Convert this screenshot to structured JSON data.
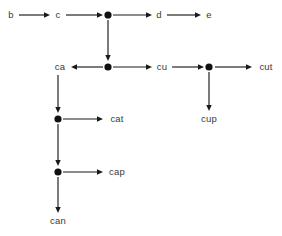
{
  "diagram": {
    "kind": "trie-graph",
    "background_color": "#ffffff",
    "stroke_color": "#1a1a1a",
    "text_color": "#3a3a3a",
    "dot_color": "#111111",
    "canvas": {
      "width": 282,
      "height": 236
    },
    "text_nodes": [
      {
        "id": "b",
        "label": "b",
        "x": 11,
        "y": 15
      },
      {
        "id": "c",
        "label": "c",
        "x": 58,
        "y": 15
      },
      {
        "id": "d",
        "label": "d",
        "x": 159,
        "y": 15
      },
      {
        "id": "e",
        "label": "e",
        "x": 209,
        "y": 15
      },
      {
        "id": "ca",
        "label": "ca",
        "x": 60,
        "y": 67
      },
      {
        "id": "cu",
        "label": "cu",
        "x": 162,
        "y": 67
      },
      {
        "id": "cut",
        "label": "cut",
        "x": 266,
        "y": 67
      },
      {
        "id": "cup",
        "label": "cup",
        "x": 209,
        "y": 119
      },
      {
        "id": "cat",
        "label": "cat",
        "x": 117,
        "y": 119
      },
      {
        "id": "cap",
        "label": "cap",
        "x": 117,
        "y": 172
      },
      {
        "id": "can",
        "label": "can",
        "x": 58,
        "y": 221
      }
    ],
    "dot_nodes": [
      {
        "id": "dot-c-branch",
        "x": 108,
        "y": 15,
        "r": 3.6
      },
      {
        "id": "dot-ca-branch",
        "x": 108,
        "y": 67,
        "r": 3.6
      },
      {
        "id": "dot-cu-branch",
        "x": 209,
        "y": 67,
        "r": 3.6
      },
      {
        "id": "dot-cat-branch",
        "x": 58,
        "y": 119,
        "r": 3.6
      },
      {
        "id": "dot-cap-branch",
        "x": 58,
        "y": 172,
        "r": 3.6
      }
    ],
    "edges": [
      {
        "id": "edge-b-to-c",
        "from": "b",
        "to": "c",
        "x1": 19,
        "y1": 15,
        "x2": 50,
        "y2": 15
      },
      {
        "id": "edge-c-to-dot",
        "from": "c",
        "to": "dot-c-branch",
        "x1": 66,
        "y1": 15,
        "x2": 103,
        "y2": 15
      },
      {
        "id": "edge-dot-to-d",
        "from": "dot-c-branch",
        "to": "d",
        "x1": 113,
        "y1": 15,
        "x2": 152,
        "y2": 15
      },
      {
        "id": "edge-d-to-e",
        "from": "d",
        "to": "e",
        "x1": 167,
        "y1": 15,
        "x2": 201,
        "y2": 15
      },
      {
        "id": "edge-dot-down",
        "from": "dot-c-branch",
        "to": "dot-ca-branch",
        "x1": 108,
        "y1": 20,
        "x2": 108,
        "y2": 61
      },
      {
        "id": "edge-dot-to-ca",
        "from": "dot-ca-branch",
        "to": "ca",
        "x1": 103,
        "y1": 67,
        "x2": 71,
        "y2": 67
      },
      {
        "id": "edge-dot-to-cu",
        "from": "dot-ca-branch",
        "to": "cu",
        "x1": 113,
        "y1": 67,
        "x2": 152,
        "y2": 67
      },
      {
        "id": "edge-cu-to-dot",
        "from": "cu",
        "to": "dot-cu-branch",
        "x1": 172,
        "y1": 67,
        "x2": 204,
        "y2": 67
      },
      {
        "id": "edge-dot-to-cut",
        "from": "dot-cu-branch",
        "to": "cut",
        "x1": 215,
        "y1": 67,
        "x2": 252,
        "y2": 67
      },
      {
        "id": "edge-dot-to-cup",
        "from": "dot-cu-branch",
        "to": "cup",
        "x1": 209,
        "y1": 72,
        "x2": 209,
        "y2": 111
      },
      {
        "id": "edge-ca-down",
        "from": "ca",
        "to": "dot-cat-branch",
        "x1": 58,
        "y1": 75,
        "x2": 58,
        "y2": 113
      },
      {
        "id": "edge-dot-to-cat",
        "from": "dot-cat-branch",
        "to": "cat",
        "x1": 63,
        "y1": 119,
        "x2": 103,
        "y2": 119
      },
      {
        "id": "edge-cat-down",
        "from": "dot-cat-branch",
        "to": "dot-cap-branch",
        "x1": 58,
        "y1": 124,
        "x2": 58,
        "y2": 166
      },
      {
        "id": "edge-dot-to-cap",
        "from": "dot-cap-branch",
        "to": "cap",
        "x1": 63,
        "y1": 172,
        "x2": 103,
        "y2": 172
      },
      {
        "id": "edge-cap-to-can",
        "from": "dot-cap-branch",
        "to": "can",
        "x1": 58,
        "y1": 177,
        "x2": 58,
        "y2": 213
      }
    ]
  }
}
